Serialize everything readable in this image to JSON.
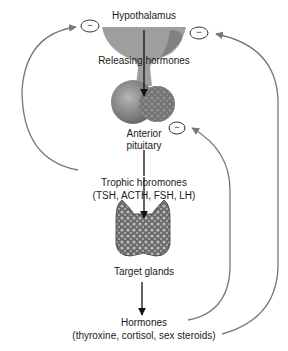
{
  "diagram": {
    "nodes": {
      "hypothalamus": "Hypothalamus",
      "releasing_hormones": "Releasing hormones",
      "anterior_pituitary_1": "Anterior",
      "anterior_pituitary_2": "pituitary",
      "trophic_1": "Trophic horomones",
      "trophic_2": "(TSH, ACTH, FSH, LH)",
      "target_glands": "Target glands",
      "hormones_1": "Hormones",
      "hormones_2": "(thyroxine, cortisol, sex steroids)"
    },
    "inhibition_symbol": "−",
    "colors": {
      "line": "#777777",
      "arrow": "#111111",
      "gland_fill": "#9a9a9a",
      "gland_dark": "#5a5a5a"
    }
  }
}
